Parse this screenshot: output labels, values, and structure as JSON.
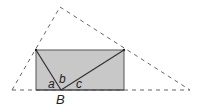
{
  "diagram": {
    "labels": {
      "a": "a",
      "b": "b",
      "c": "c",
      "B": "B"
    },
    "colors": {
      "rect_fill": "#c8c8c8",
      "rect_stroke": "#555555",
      "dashed_stroke": "#666666",
      "solid_stroke": "#333333"
    },
    "shapes": {
      "rectangle": {
        "x": 36,
        "y": 50,
        "width": 88,
        "height": 40
      },
      "dashed_triangle": [
        [
          12,
          90
        ],
        [
          60,
          7
        ],
        [
          190,
          90
        ]
      ],
      "point_B": [
        61,
        90
      ],
      "segments": [
        {
          "from": [
            36,
            50
          ],
          "to": [
            61,
            90
          ]
        },
        {
          "from": [
            61,
            90
          ],
          "to": [
            124,
            50
          ]
        }
      ]
    }
  }
}
